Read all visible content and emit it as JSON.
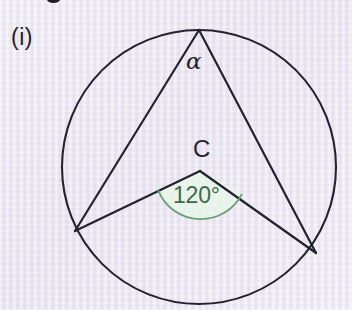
{
  "page": {
    "background_color": "#ecebf3",
    "width": 352,
    "height": 310
  },
  "figure": {
    "part_label": "(i)",
    "alpha_label": "α",
    "center_label": "C",
    "angle_label": "120°",
    "stroke_color": "#23232f",
    "angle_arc_color": "#6a9d78",
    "angle_fill_color": "#e7f2e7",
    "angle_text_color": "#3c6b4a",
    "label_color": "#23233a",
    "circle": {
      "center_x": 199,
      "center_y": 167,
      "radius": 137
    },
    "points": {
      "apex_top": {
        "x": 199,
        "y": 30
      },
      "left_vertex": {
        "x": 75,
        "y": 231
      },
      "right_vertex": {
        "x": 316,
        "y": 253
      },
      "center_c": {
        "x": 200,
        "y": 171
      }
    },
    "angle_arc": {
      "radius": 46,
      "start_x": 158,
      "start_y": 191,
      "end_x": 242,
      "end_y": 194
    }
  }
}
